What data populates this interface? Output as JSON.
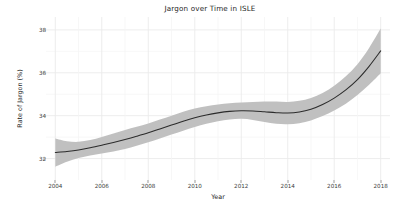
{
  "chart_data": {
    "type": "line",
    "title": "Jargon over Time in ISLE",
    "xlabel": "Year",
    "ylabel": "Rate of Jargon (%)",
    "xlim": [
      2003.6,
      2018.4
    ],
    "ylim": [
      31.0,
      38.6
    ],
    "xticks": [
      2004,
      2006,
      2008,
      2010,
      2012,
      2014,
      2016,
      2018
    ],
    "xticklabels": [
      "2004",
      "2006",
      "2008",
      "2010",
      "2012",
      "2014",
      "2016",
      "2018"
    ],
    "yticks": [
      32,
      34,
      36,
      38
    ],
    "yticklabels": [
      "32",
      "34",
      "36",
      "38"
    ],
    "grid": true,
    "grid_color": "#ebebeb",
    "panel_background": "#ffffff",
    "legend": null,
    "series": [
      {
        "name": "Rate of Jargon (%)",
        "style": "smooth-loess",
        "line_color": "#2b2b2b",
        "band_color": "#bfbfbf",
        "band_label": "95% confidence interval",
        "x": [
          2004,
          2004.5,
          2005,
          2005.5,
          2006,
          2006.5,
          2007,
          2007.5,
          2008,
          2008.5,
          2009,
          2009.5,
          2010,
          2010.5,
          2011,
          2011.5,
          2012,
          2012.5,
          2013,
          2013.5,
          2014,
          2014.5,
          2015,
          2015.5,
          2016,
          2016.5,
          2017,
          2017.5,
          2018
        ],
        "y": [
          32.28,
          32.33,
          32.4,
          32.5,
          32.62,
          32.75,
          32.89,
          33.04,
          33.2,
          33.38,
          33.56,
          33.74,
          33.9,
          34.03,
          34.13,
          34.2,
          34.23,
          34.22,
          34.18,
          34.14,
          34.12,
          34.17,
          34.3,
          34.52,
          34.82,
          35.2,
          35.68,
          36.3,
          37.02
        ],
        "ymin": [
          31.62,
          31.85,
          32.02,
          32.14,
          32.23,
          32.33,
          32.45,
          32.6,
          32.76,
          32.94,
          33.12,
          33.3,
          33.47,
          33.62,
          33.74,
          33.82,
          33.85,
          33.8,
          33.7,
          33.62,
          33.6,
          33.65,
          33.78,
          33.98,
          34.24,
          34.56,
          34.96,
          35.44,
          35.98
        ],
        "ymax": [
          32.94,
          32.81,
          32.78,
          32.86,
          33.01,
          33.17,
          33.33,
          33.48,
          33.64,
          33.82,
          34.0,
          34.18,
          34.33,
          34.44,
          34.52,
          34.58,
          34.61,
          34.64,
          34.66,
          34.66,
          34.64,
          34.69,
          34.82,
          35.06,
          35.4,
          35.84,
          36.4,
          37.16,
          38.06
        ]
      }
    ]
  }
}
